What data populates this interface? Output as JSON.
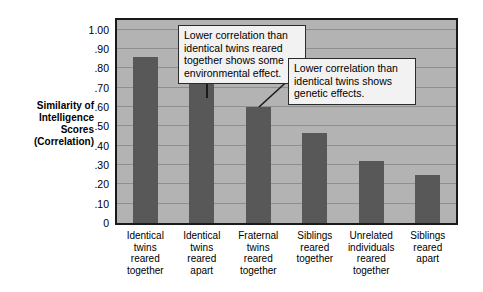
{
  "chart_data": {
    "type": "bar",
    "title": "",
    "xlabel": "",
    "ylabel": "Similarity of Intelligence Scores (Correlation)",
    "ylim": [
      0,
      1.05
    ],
    "grid": true,
    "legend": "none",
    "categories": [
      "Identical twins reared together",
      "Identical twins reared apart",
      "Fraternal twins reared together",
      "Siblings reared together",
      "Unrelated individuals reared together",
      "Siblings reared apart"
    ],
    "category_lines": [
      [
        "Identical",
        "twins",
        "reared",
        "together"
      ],
      [
        "Identical",
        "twins",
        "reared",
        "apart"
      ],
      [
        "Fraternal",
        "twins",
        "reared",
        "together"
      ],
      [
        "Siblings",
        "reared",
        "together"
      ],
      [
        "Unrelated",
        "individuals",
        "reared",
        "together"
      ],
      [
        "Siblings",
        "reared",
        "apart"
      ]
    ],
    "values": [
      0.86,
      0.73,
      0.6,
      0.465,
      0.32,
      0.25
    ],
    "ytick_values": [
      0,
      0.1,
      0.2,
      0.3,
      0.4,
      0.5,
      0.6,
      0.7,
      0.8,
      0.9,
      1.0
    ],
    "ytick_labels": [
      "0",
      ".10",
      ".20",
      ".30",
      ".40",
      ".50",
      ".60",
      ".70",
      ".80",
      ".90",
      "1.00"
    ],
    "annotations": [
      {
        "id": "environmental",
        "lines": [
          "Lower correlation than",
          "identical twins reared",
          "together shows some",
          "environmental effect."
        ],
        "points_to_category": "Identical twins reared apart"
      },
      {
        "id": "genetic",
        "lines": [
          "Lower correlation than",
          "identical twins shows",
          "genetic effects."
        ],
        "points_to_category": "Fraternal twins reared together"
      }
    ],
    "colors": {
      "bar": "#585858",
      "plot_background": "#b3b3b3",
      "gridline": "#8f8f8f",
      "frame": "#1a1a1a",
      "callout_background": "#f2f2f2",
      "callout_border": "#2b2b2b",
      "page_background": "#ffffff",
      "text": "#000000"
    }
  },
  "y_axis_title_lines": [
    "Similarity of",
    "Intelligence",
    "Scores",
    "(Correlation)"
  ]
}
